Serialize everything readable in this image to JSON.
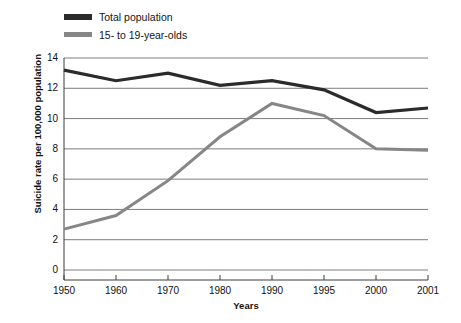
{
  "chart_data": {
    "type": "line",
    "title": "",
    "xlabel": "Years",
    "ylabel": "Suicide rate per 100,000 population",
    "categories": [
      "1950",
      "1960",
      "1970",
      "1980",
      "1990",
      "1995",
      "2000",
      "2001"
    ],
    "ylim": [
      0,
      14
    ],
    "yticks": [
      "0",
      "2",
      "4",
      "6",
      "8",
      "10",
      "12",
      "14"
    ],
    "grid": true,
    "legend_position": "top-left",
    "series": [
      {
        "name": "Total population",
        "color": "#2b2b2b",
        "values": [
          13.2,
          12.5,
          13.0,
          12.2,
          12.5,
          11.9,
          10.4,
          10.7
        ]
      },
      {
        "name": "15- to 19-year-olds",
        "color": "#868686",
        "values": [
          2.7,
          3.6,
          5.9,
          8.8,
          11.0,
          10.2,
          8.0,
          7.9
        ]
      }
    ]
  },
  "axis": {
    "y_title": "Suicide rate per 100,000 population",
    "x_title": "Years"
  },
  "legend": {
    "items": [
      {
        "label": "Total population"
      },
      {
        "label": "15- to 19-year-olds"
      }
    ]
  },
  "colors": {
    "series_total_population": "#2b2b2b",
    "series_teens": "#868686",
    "gridline": "#5a5a5a",
    "axis": "#3a3a3a",
    "background": "#ffffff"
  }
}
